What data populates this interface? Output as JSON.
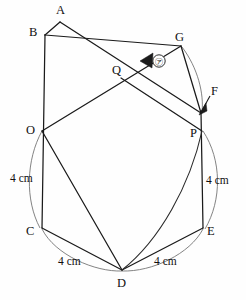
{
  "figure": {
    "type": "geometry-diagram",
    "background_color": "#fefefe",
    "line_color": "#1a1a1a",
    "arc_color": "#6d6d6d",
    "wedge_color": "#1b1b1b"
  },
  "vertices": [
    {
      "id": "A",
      "label": "A",
      "x": 60,
      "y": 22,
      "label_x": 61,
      "label_y": 13
    },
    {
      "id": "B",
      "label": "B",
      "x": 45,
      "y": 35,
      "label_x": 34,
      "label_y": 33
    },
    {
      "id": "G",
      "label": "G",
      "x": 181,
      "y": 46,
      "label_x": 178,
      "label_y": 38
    },
    {
      "id": "Q",
      "label": "Q",
      "x": 121,
      "y": 78,
      "label_x": 115,
      "label_y": 73
    },
    {
      "id": "F",
      "label": "F",
      "x": 201,
      "y": 113,
      "label_x": 212,
      "label_y": 92
    },
    {
      "id": "O",
      "label": "O",
      "x": 42,
      "y": 131,
      "label_x": 31,
      "label_y": 130
    },
    {
      "id": "P",
      "label": "P",
      "x": 202,
      "y": 131,
      "label_x": 193,
      "label_y": 136
    },
    {
      "id": "C",
      "label": "C",
      "x": 42,
      "y": 228,
      "label_x": 30,
      "label_y": 230
    },
    {
      "id": "E",
      "label": "E",
      "x": 203,
      "y": 228,
      "label_x": 206,
      "label_y": 230
    },
    {
      "id": "D",
      "label": "D",
      "x": 122,
      "y": 270,
      "label_x": 118,
      "label_y": 285
    }
  ],
  "angle_marker": {
    "name": "angle-ga",
    "glyph": "㋐",
    "circle_x": 159,
    "circle_y": 61,
    "circle_r": 6.2,
    "wedge_vertex_x": 140,
    "wedge_vertex_y": 61
  },
  "dimensions": [
    {
      "id": "left",
      "text": "4 cm",
      "x": 10,
      "y": 178
    },
    {
      "id": "right",
      "text": "4 cm",
      "x": 206,
      "y": 180
    },
    {
      "id": "bottom-left",
      "text": "4 cm",
      "x": 60,
      "y": 262
    },
    {
      "id": "bottom-right",
      "text": "4 cm",
      "x": 155,
      "y": 262
    }
  ],
  "segments": [
    {
      "from": "A",
      "to": "B",
      "note": "top short edge"
    },
    {
      "from": "A",
      "to": "F",
      "note": "long edge A down-right to F"
    },
    {
      "from": "B",
      "to": "G",
      "note": "long edge B down-right through Q to G side"
    },
    {
      "from": "B",
      "to": "C",
      "note": "left vertical through O"
    },
    {
      "from": "O",
      "to": "G",
      "note": "rising edge O through Q to G"
    },
    {
      "from": "Q",
      "to": "P",
      "note": "descending edge Q to P"
    },
    {
      "from": "G",
      "to": "F",
      "note": "short right edge"
    },
    {
      "from": "F",
      "to": "E",
      "note": "right vertical through P"
    },
    {
      "from": "O",
      "to": "D",
      "note": "slant to bottom apex"
    },
    {
      "from": "C",
      "to": "D",
      "note": "bottom-left edge 4 cm"
    },
    {
      "from": "E",
      "to": "D",
      "note": "bottom-right edge 4 cm"
    },
    {
      "from": "P",
      "to": "D",
      "note": "curved edge P to D"
    }
  ],
  "arcs": [
    {
      "id": "arc-O-C",
      "note": "thin arc bulging left between O and C"
    },
    {
      "id": "arc-P-E",
      "note": "thin arc bulging right between P and E"
    },
    {
      "id": "arc-C-D",
      "note": "thin arc below segment C-D"
    },
    {
      "id": "arc-D-E",
      "note": "thin arc below segment D-E"
    },
    {
      "id": "arc-G-F",
      "note": "thin arc bulging right between G and F"
    }
  ]
}
